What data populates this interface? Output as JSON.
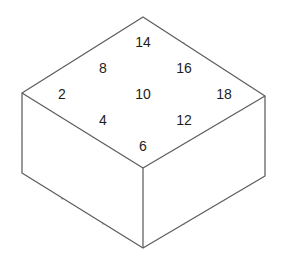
{
  "figure": {
    "type": "isometric-cube-grid",
    "background_color": "#ffffff",
    "line_color": "#6e6e6e",
    "label_color": "#1d1d1d",
    "dimensions": {
      "columns_right": 3,
      "columns_left": 3,
      "layers_tall": 2
    },
    "geometry": {
      "top_apex": {
        "x": 143,
        "y": 17
      },
      "left_corner": {
        "x": 22,
        "y": 93
      },
      "right_corner": {
        "x": 265,
        "y": 96
      },
      "front_vertex": {
        "x": 143,
        "y": 168
      },
      "bottom_vertex": {
        "x": 143,
        "y": 248
      },
      "layer_height": 40
    }
  },
  "top_face": {
    "description": "3 by 3 diamond grid of cube tops, each labeled with an even number",
    "rows": [
      {
        "row_index": 0,
        "cells": [
          {
            "id": "cell-r0-c0",
            "label": "2",
            "cx": 62,
            "cy": 95
          },
          {
            "id": "cell-r0-c1",
            "label": "8",
            "cx": 103,
            "cy": 69
          },
          {
            "id": "cell-r0-c2",
            "label": "14",
            "cx": 143,
            "cy": 43
          }
        ]
      },
      {
        "row_index": 1,
        "cells": [
          {
            "id": "cell-r1-c0",
            "label": "4",
            "cx": 103,
            "cy": 121
          },
          {
            "id": "cell-r1-c1",
            "label": "10",
            "cx": 143,
            "cy": 95
          },
          {
            "id": "cell-r1-c2",
            "label": "16",
            "cx": 184,
            "cy": 69
          }
        ]
      },
      {
        "row_index": 2,
        "cells": [
          {
            "id": "cell-r2-c0",
            "label": "6",
            "cx": 143,
            "cy": 147
          },
          {
            "id": "cell-r2-c1",
            "label": "12",
            "cx": 184,
            "cy": 121
          },
          {
            "id": "cell-r2-c2",
            "label": "18",
            "cx": 224,
            "cy": 95
          }
        ]
      }
    ],
    "all_labels": [
      "2",
      "8",
      "14",
      "4",
      "10",
      "16",
      "6",
      "12",
      "18"
    ]
  },
  "left_face": {
    "description": "Front-left visible side of the stack, 3 columns wide and 2 layers tall",
    "columns": 3,
    "rows": 2
  },
  "right_face": {
    "description": "Front-right visible side of the stack, 3 columns wide and 2 layers tall",
    "columns": 3,
    "rows": 2
  }
}
